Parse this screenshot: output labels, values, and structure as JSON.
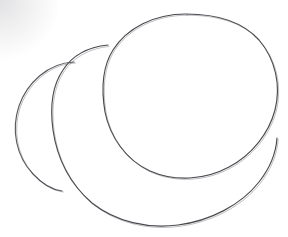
{
  "artwork": {
    "title": "Overlapping Circles Pencil Sketch",
    "medium": "graphite pencil on paper",
    "subject": "three overlapping freehand circles",
    "canvas": {
      "width": 288,
      "height": 237
    },
    "background_color": "#ffffff",
    "stroke_color": "#4a4a50",
    "stroke_color_light": "#7b7b84",
    "stroke_width": 1.1,
    "vignette": {
      "corner": "top-left",
      "color": "#787880",
      "opacity": 0.22
    }
  },
  "shapes": [
    {
      "name": "back-circle",
      "label": "Back circle (smallest, upper-left)",
      "center_x": 72,
      "center_y": 118,
      "radius": 56,
      "z_order": 1,
      "stroke_color": "#55555c",
      "path": "M 74,62 C 48,63 27,83 19,106 C 11,130 16,156 33,174 C 44,186 54,190 62,191"
    },
    {
      "name": "middle-circle",
      "label": "Middle circle (largest, lower)",
      "center_x": 150,
      "center_y": 130,
      "radius": 97,
      "z_order": 2,
      "stroke_color": "#4a4a50",
      "path": "M 108,45 C 88,47 72,56 63,70 C 52,86 50,108 53,130 C 57,158 70,184 92,203 C 116,222 148,229 178,225 C 210,221 241,205 259,182 C 270,168 276,153 277,138"
    },
    {
      "name": "front-circle",
      "label": "Front circle (top-right, foremost)",
      "center_x": 190,
      "center_y": 95,
      "radius": 87,
      "z_order": 3,
      "stroke_color": "#4a4a50",
      "path": "M 186,14 C 154,14 127,28 113,50 C 101,69 102,94 105,112 C 110,137 126,160 150,171 C 175,182 205,180 229,167 C 252,155 269,133 275,110 C 281,86 276,60 259,40 C 241,20 213,14 186,14 Z"
    }
  ],
  "layers": {
    "paper_label": "paper",
    "strokes_label": "pencil strokes"
  }
}
